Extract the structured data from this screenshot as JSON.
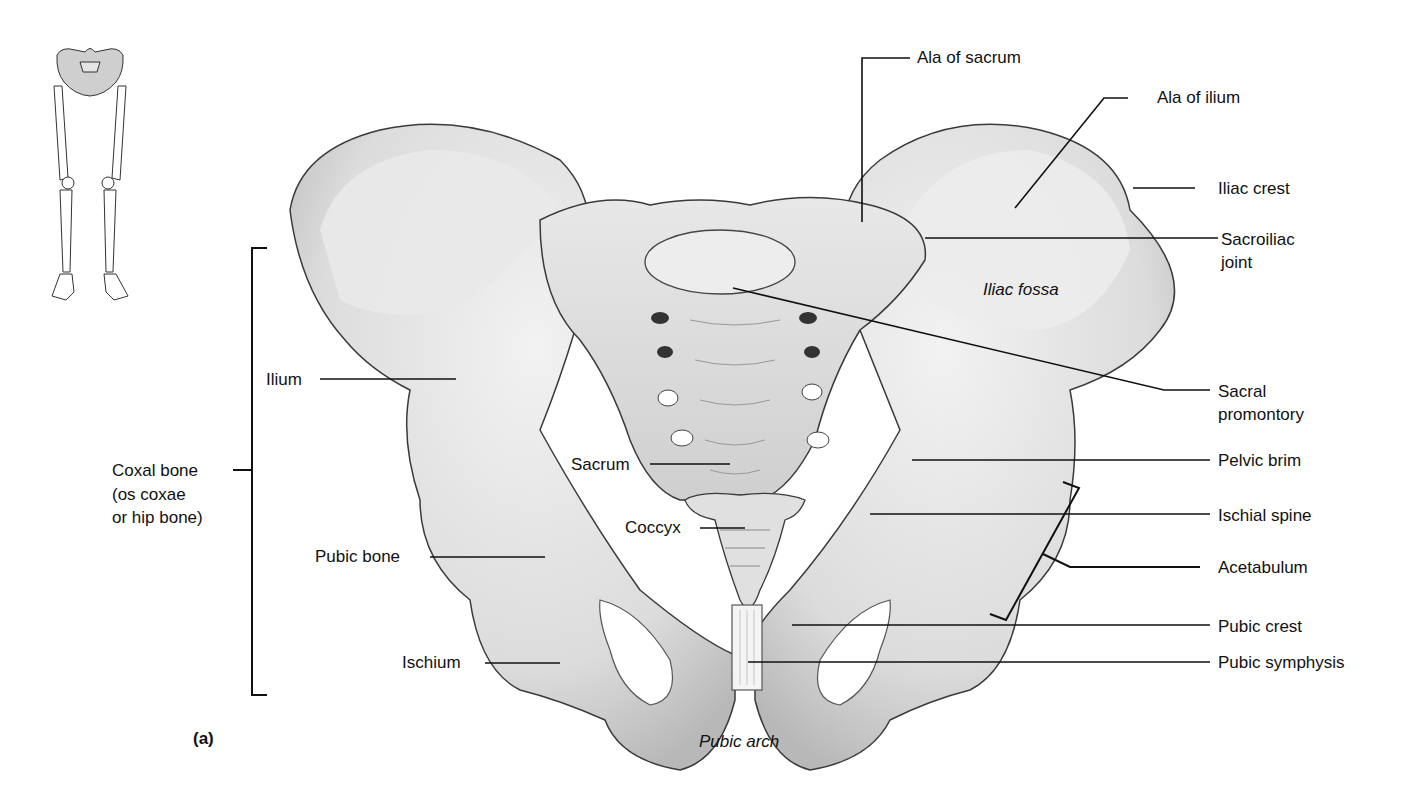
{
  "figure": {
    "panel_label": "(a)",
    "thumbnail": "lower-limb-skeleton-with-pelvis-highlighted"
  },
  "labels_left": {
    "coxal_bone_line1": "Coxal bone",
    "coxal_bone_line2": "(os coxae",
    "coxal_bone_line3": "or hip bone)",
    "ilium": "Ilium",
    "pubic_bone": "Pubic bone",
    "ischium": "Ischium"
  },
  "labels_center": {
    "sacrum": "Sacrum",
    "coccyx": "Coccyx",
    "pubic_arch": "Pubic arch",
    "iliac_fossa": "Iliac fossa"
  },
  "labels_right": {
    "ala_of_sacrum": "Ala of sacrum",
    "ala_of_ilium": "Ala of ilium",
    "iliac_crest": "Iliac crest",
    "sacroiliac_line1": "Sacroiliac",
    "sacroiliac_line2": "joint",
    "sacral_promontory_line1": "Sacral",
    "sacral_promontory_line2": "promontory",
    "pelvic_brim": "Pelvic brim",
    "ischial_spine": "Ischial spine",
    "acetabulum": "Acetabulum",
    "pubic_crest": "Pubic crest",
    "pubic_symphysis": "Pubic symphysis"
  },
  "colors": {
    "bone_fill": "#e6e6e6",
    "bone_shade": "#bdbdbd",
    "outline": "#3a3a3a",
    "leader": "#111111",
    "background": "#ffffff"
  }
}
